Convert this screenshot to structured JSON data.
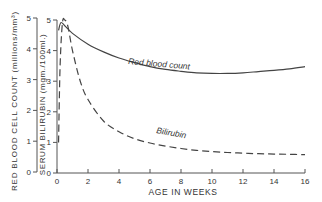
{
  "chart_data": {
    "type": "line",
    "title": "",
    "xlabel": "AGE IN WEEKS",
    "ylabel_outer": "RED BLOOD CELL COUNT (millions/mm³)",
    "ylabel_inner": "SERUM BILIRUBIN (mgm./100ml.)",
    "x_ticks": [
      0,
      2,
      4,
      6,
      8,
      10,
      12,
      14,
      16
    ],
    "y_ticks_outer": [
      0,
      1,
      2,
      3,
      4,
      5
    ],
    "y_ticks_inner": [
      0,
      1,
      2,
      3,
      4,
      5
    ],
    "xlim": [
      0,
      16
    ],
    "ylim": [
      0,
      5
    ],
    "grid": false,
    "series": [
      {
        "name": "Red blood count",
        "style": "solid",
        "axis": "outer",
        "x": [
          0.1,
          0.25,
          0.5,
          1,
          2,
          3,
          4,
          5,
          6,
          7,
          8,
          9,
          10,
          11,
          12,
          13,
          14,
          15,
          16
        ],
        "values": [
          4.6,
          4.85,
          4.75,
          4.5,
          4.15,
          3.9,
          3.7,
          3.55,
          3.42,
          3.33,
          3.27,
          3.22,
          3.2,
          3.2,
          3.22,
          3.26,
          3.3,
          3.35,
          3.42
        ]
      },
      {
        "name": "Bilirubin",
        "style": "dashed",
        "axis": "inner",
        "x": [
          0.1,
          0.2,
          0.35,
          0.5,
          0.7,
          1,
          1.5,
          2,
          3,
          4,
          5,
          6,
          7,
          8,
          9,
          10,
          11,
          12,
          13,
          14,
          15,
          16
        ],
        "values": [
          1.0,
          3.5,
          4.9,
          5.0,
          4.8,
          4.0,
          3.0,
          2.4,
          1.7,
          1.35,
          1.12,
          0.98,
          0.88,
          0.8,
          0.74,
          0.7,
          0.67,
          0.65,
          0.63,
          0.62,
          0.61,
          0.6
        ]
      }
    ],
    "annotations": [
      "Red blood count",
      "Bilirubin"
    ]
  }
}
